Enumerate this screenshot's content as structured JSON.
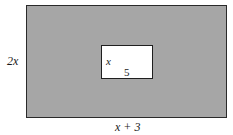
{
  "diagram": {
    "type": "nested-rectangles",
    "outer_rectangle": {
      "fill_color": "#a6a6a6",
      "border_color": "#2a2a2a",
      "height_label": "2x",
      "width_label": "x + 3"
    },
    "inner_rectangle": {
      "fill_color": "#ffffff",
      "border_color": "#1f1f1f",
      "height_label": "x",
      "width_label": "5"
    }
  }
}
